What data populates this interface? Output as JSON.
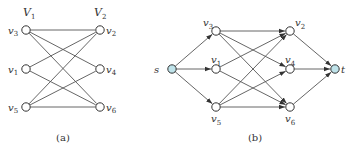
{
  "figure": {
    "diagram_a": {
      "caption": "(a)",
      "set_labels": [
        {
          "id": "V1",
          "base": "V",
          "sub": "1",
          "x": 23,
          "y": 16
        },
        {
          "id": "V2",
          "base": "V",
          "sub": "2",
          "x": 94,
          "y": 16
        }
      ],
      "nodes": [
        {
          "id": "v3",
          "base": "v",
          "sub": "3",
          "x": 26,
          "y": 30,
          "label_side": "left"
        },
        {
          "id": "v1",
          "base": "v",
          "sub": "1",
          "x": 26,
          "y": 69,
          "label_side": "left"
        },
        {
          "id": "v5",
          "base": "v",
          "sub": "5",
          "x": 26,
          "y": 107,
          "label_side": "left"
        },
        {
          "id": "v2",
          "base": "v",
          "sub": "2",
          "x": 100,
          "y": 30,
          "label_side": "right"
        },
        {
          "id": "v4",
          "base": "v",
          "sub": "4",
          "x": 100,
          "y": 69,
          "label_side": "right"
        },
        {
          "id": "v6",
          "base": "v",
          "sub": "6",
          "x": 100,
          "y": 107,
          "label_side": "right"
        }
      ],
      "edges": [
        [
          "v3",
          "v2"
        ],
        [
          "v3",
          "v4"
        ],
        [
          "v3",
          "v6"
        ],
        [
          "v1",
          "v2"
        ],
        [
          "v1",
          "v6"
        ],
        [
          "v5",
          "v2"
        ],
        [
          "v5",
          "v4"
        ],
        [
          "v5",
          "v6"
        ]
      ],
      "directed": false
    },
    "diagram_b": {
      "caption": "(b)",
      "nodes": [
        {
          "id": "s",
          "base": "s",
          "sub": "",
          "x": 172,
          "y": 69,
          "label_side": "left",
          "terminal": true
        },
        {
          "id": "v3",
          "base": "v",
          "sub": "3",
          "x": 216,
          "y": 31,
          "label_side": "top-left",
          "terminal": false
        },
        {
          "id": "v1",
          "base": "v",
          "sub": "1",
          "x": 216,
          "y": 69,
          "label_side": "top",
          "terminal": false
        },
        {
          "id": "v5",
          "base": "v",
          "sub": "5",
          "x": 216,
          "y": 107,
          "label_side": "bottom",
          "terminal": false
        },
        {
          "id": "v2",
          "base": "v",
          "sub": "2",
          "x": 290,
          "y": 31,
          "label_side": "top-right",
          "terminal": false
        },
        {
          "id": "v4",
          "base": "v",
          "sub": "4",
          "x": 290,
          "y": 69,
          "label_side": "top",
          "terminal": false
        },
        {
          "id": "v6",
          "base": "v",
          "sub": "6",
          "x": 290,
          "y": 107,
          "label_side": "bottom",
          "terminal": false
        },
        {
          "id": "t",
          "base": "t",
          "sub": "",
          "x": 335,
          "y": 69,
          "label_side": "right",
          "terminal": true
        }
      ],
      "edges": [
        [
          "s",
          "v3"
        ],
        [
          "s",
          "v1"
        ],
        [
          "s",
          "v5"
        ],
        [
          "v3",
          "v2"
        ],
        [
          "v3",
          "v4"
        ],
        [
          "v3",
          "v6"
        ],
        [
          "v1",
          "v2"
        ],
        [
          "v1",
          "v6"
        ],
        [
          "v5",
          "v2"
        ],
        [
          "v5",
          "v4"
        ],
        [
          "v5",
          "v6"
        ],
        [
          "v2",
          "t"
        ],
        [
          "v4",
          "t"
        ],
        [
          "v6",
          "t"
        ]
      ],
      "directed": true
    },
    "colors": {
      "edge": "#555555",
      "node_stroke": "#333333",
      "node_fill": "#ffffff",
      "terminal_fill": "#bfe3ea",
      "text": "#333333"
    }
  }
}
